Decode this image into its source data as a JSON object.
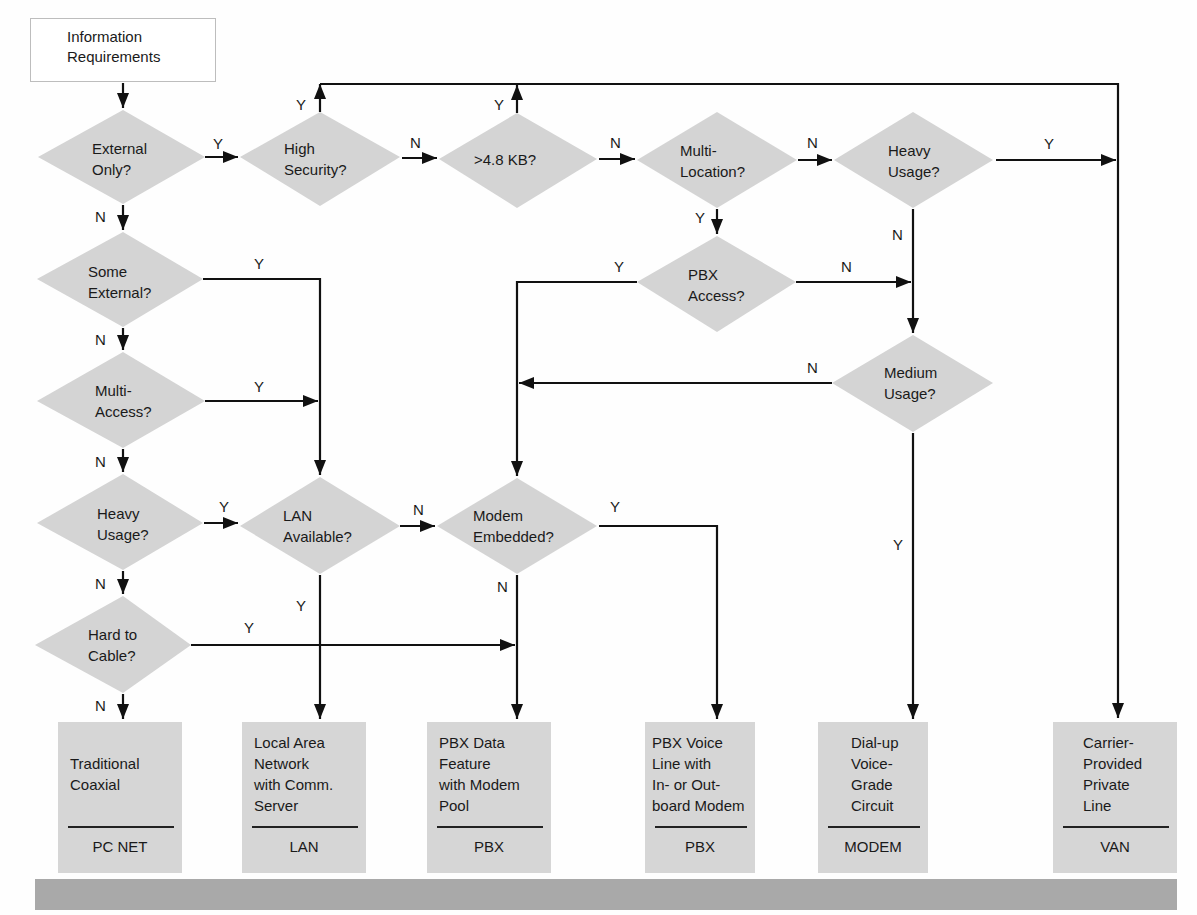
{
  "start": {
    "label": "Information\nRequirements"
  },
  "decisions": [
    {
      "id": "external_only",
      "label": "External\nOnly?"
    },
    {
      "id": "high_security",
      "label": "High\nSecurity?"
    },
    {
      "id": "gt_4_8kb",
      "label": ">4.8 KB?"
    },
    {
      "id": "multi_location",
      "label": "Multi-\nLocation?"
    },
    {
      "id": "heavy_usage_top",
      "label": "Heavy\nUsage?"
    },
    {
      "id": "some_external",
      "label": "Some\nExternal?"
    },
    {
      "id": "pbx_access",
      "label": "PBX\nAccess?"
    },
    {
      "id": "multi_access",
      "label": "Multi-\nAccess?"
    },
    {
      "id": "medium_usage",
      "label": "Medium\nUsage?"
    },
    {
      "id": "heavy_usage_left",
      "label": "Heavy\nUsage?"
    },
    {
      "id": "lan_available",
      "label": "LAN\nAvailable?"
    },
    {
      "id": "modem_embedded",
      "label": "Modem\nEmbedded?"
    },
    {
      "id": "hard_to_cable",
      "label": "Hard to\nCable?"
    }
  ],
  "outcomes": [
    {
      "description": "\nTraditional\nCoaxial",
      "code": "PC NET"
    },
    {
      "description": "Local Area\nNetwork\nwith Comm.\nServer",
      "code": "LAN"
    },
    {
      "description": "PBX Data\nFeature\nwith Modem\nPool",
      "code": "PBX"
    },
    {
      "description": "PBX Voice\nLine with\nIn- or Out-\nboard Modem",
      "code": "PBX"
    },
    {
      "description": "Dial-up\nVoice-\nGrade\nCircuit",
      "code": "MODEM"
    },
    {
      "description": "Carrier-\nProvided\nPrivate\nLine",
      "code": "VAN"
    }
  ],
  "edge_labels": {
    "yes": "Y",
    "no": "N"
  },
  "colors": {
    "decision_fill": "#d4d4d4",
    "outcome_fill": "#d6d6d6",
    "line": "#111111",
    "bar": "#a9a9a9"
  }
}
